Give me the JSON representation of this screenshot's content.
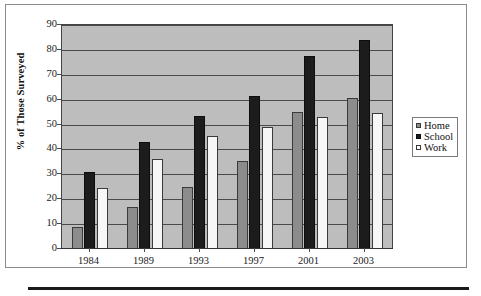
{
  "chart_data": {
    "type": "bar",
    "title": "",
    "subtitle": "",
    "xlabel": "",
    "ylabel": "% of Those Surveyed",
    "categories": [
      "1984",
      "1989",
      "1993",
      "1997",
      "2001",
      "2003"
    ],
    "series": [
      {
        "name": "Home",
        "color": "#8c8c8c",
        "values": [
          9,
          17,
          25,
          35.5,
          55,
          60.5
        ]
      },
      {
        "name": "School",
        "color": "#1c1c1c",
        "values": [
          31,
          43,
          53.5,
          61.5,
          77.5,
          84
        ]
      },
      {
        "name": "Work",
        "color": "#f7f7f7",
        "values": [
          24.5,
          36,
          45.5,
          49,
          53,
          54.5
        ]
      }
    ],
    "ylim": [
      0,
      90
    ],
    "ytick_values": [
      0,
      10,
      20,
      30,
      40,
      50,
      60,
      70,
      80,
      90
    ],
    "ytick_labels": [
      "0",
      "10",
      "20",
      "30",
      "40",
      "50",
      "60",
      "70",
      "80",
      "90"
    ],
    "grid": true,
    "grid_axis": "y",
    "legend_position": "right",
    "legend_entries": [
      "Home",
      "School",
      "Work"
    ],
    "plot_background": "#bdbdbd",
    "annotations": []
  },
  "legend": {
    "items": [
      {
        "label": "Home",
        "swatch": "home-swatch"
      },
      {
        "label": "School",
        "swatch": "school-swatch"
      },
      {
        "label": "Work",
        "swatch": "work-swatch"
      }
    ]
  },
  "axes": {
    "y_title": "% of Those Surveyed"
  }
}
